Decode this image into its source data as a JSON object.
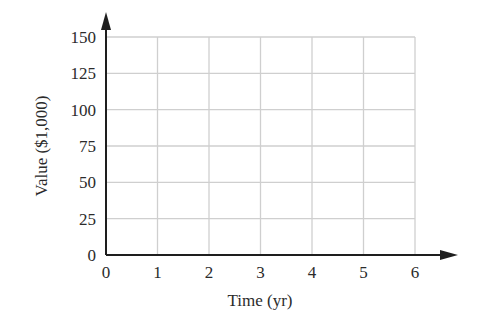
{
  "chart_data": {
    "type": "line",
    "title": "",
    "xlabel": "Time (yr)",
    "ylabel": "Value ($1,000)",
    "x_ticks": [
      "0",
      "1",
      "2",
      "3",
      "4",
      "5",
      "6"
    ],
    "y_ticks": [
      "0",
      "25",
      "50",
      "75",
      "100",
      "125",
      "150"
    ],
    "xlim": [
      0,
      6
    ],
    "ylim": [
      0,
      150
    ],
    "grid": true,
    "series": [],
    "legend": null
  },
  "colors": {
    "axis": "#1e1e1e",
    "grid": "#cfcfcf",
    "text": "#2b2b2b"
  }
}
